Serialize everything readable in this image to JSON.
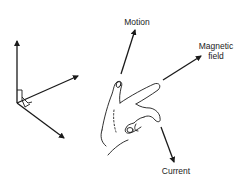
{
  "diagram": {
    "type": "hand-rule-illustration",
    "labels": {
      "motion": "Motion",
      "magnetic_field_line1": "Magnetic",
      "magnetic_field_line2": "field",
      "current": "Current"
    },
    "axes": {
      "count": 3,
      "right_angle_markers": true
    },
    "colors": {
      "ink": "#1a1a1a",
      "background": "#ffffff"
    }
  }
}
